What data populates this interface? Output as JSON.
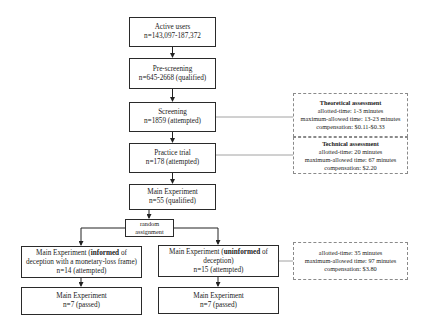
{
  "diagram": {
    "type": "flowchart",
    "main_flow": [
      {
        "id": "active-users",
        "title": "Active users",
        "count": "n=143,097-187,372"
      },
      {
        "id": "pre-screening",
        "title": "Pre-screening",
        "count": "n=645-2668 (qualified)"
      },
      {
        "id": "screening",
        "title": "Screening",
        "count": "n=1859 (attempted)"
      },
      {
        "id": "practice-trial",
        "title": "Practice trial",
        "count": "n=178  (attempted)"
      },
      {
        "id": "main-experiment",
        "title": "Main Experiment",
        "count": "n=55 (qualified)"
      }
    ],
    "random_assignment": {
      "line1": "random",
      "line2": "assignment"
    },
    "branches": {
      "left": {
        "title_prefix": "Main Experiment (",
        "title_bold": "informed",
        "title_suffix": " of",
        "title_line2": "deception with a monetary-loss frame)",
        "count": "n=14 (attempted)",
        "result_title": "Main Experiment",
        "result_count": "n=7 (passed)"
      },
      "right": {
        "title_prefix": "Main Experiment (",
        "title_bold": "uninformed",
        "title_suffix": " of",
        "title_line2": "deception)",
        "count": "n=15 (attempted)",
        "result_title": "Main Experiment",
        "result_count": "n=7 (passed)"
      }
    },
    "notes": {
      "theoretical": {
        "heading": "Theoretical assessment",
        "allotted": "allotted-time: 1-3 minutes",
        "max_allowed": "maximum-allowed time: 13-23 minutes",
        "compensation": "compensation: $0.11-$0.33"
      },
      "technical": {
        "heading": "Technical assessment",
        "allotted": "allotted-time: 20 minutes",
        "max_allowed": "maximum-allowed time: 67 minutes",
        "compensation": "compensation: $2.20"
      },
      "main": {
        "allotted": "allotted-time: 35 minutes",
        "max_allowed": "maximum-allowed time: 97 minutes",
        "compensation": "compensation: $3.80"
      }
    },
    "colors": {
      "box_border": "#2a2a2a",
      "note_border": "#8a8a8a",
      "connector": "#8a8a8a",
      "background": "#ffffff"
    }
  }
}
